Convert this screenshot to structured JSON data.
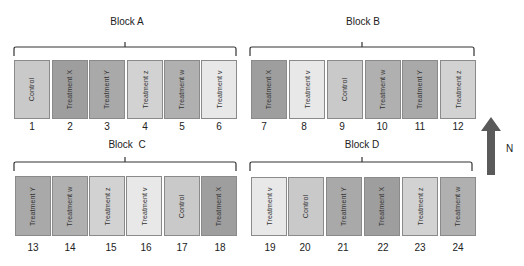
{
  "colors": {
    "Control": "#c9c9c9",
    "Treatment X": "#9e9e9e",
    "Treatment Y": "#a9a9a9",
    "Treatment z": "#d2d2d2",
    "Treatment w": "#b0b0b0",
    "Treatment v": "#e8e8e8"
  },
  "blocks": [
    {
      "label": "Block A",
      "plots": [
        {
          "number": "1",
          "treatment": "Control"
        },
        {
          "number": "2",
          "treatment": "Treatment X"
        },
        {
          "number": "3",
          "treatment": "Treatment Y"
        },
        {
          "number": "4",
          "treatment": "Treatment z"
        },
        {
          "number": "5",
          "treatment": "Treatment w"
        },
        {
          "number": "6",
          "treatment": "Treatment v"
        }
      ]
    },
    {
      "label": "Block B",
      "plots": [
        {
          "number": "7",
          "treatment": "Treatment X"
        },
        {
          "number": "8",
          "treatment": "Treatment v"
        },
        {
          "number": "9",
          "treatment": "Control"
        },
        {
          "number": "10",
          "treatment": "Treatment w"
        },
        {
          "number": "11",
          "treatment": "Treatment Y"
        },
        {
          "number": "12",
          "treatment": "Treatment z"
        }
      ]
    },
    {
      "label": "Block  C",
      "plots": [
        {
          "number": "13",
          "treatment": "Treatment Y"
        },
        {
          "number": "14",
          "treatment": "Treatment w"
        },
        {
          "number": "15",
          "treatment": "Treatment z"
        },
        {
          "number": "16",
          "treatment": "Treatment v"
        },
        {
          "number": "17",
          "treatment": "Control"
        },
        {
          "number": "18",
          "treatment": "Treatment X"
        }
      ]
    },
    {
      "label": "Block D",
      "plots": [
        {
          "number": "19",
          "treatment": "Treatment v"
        },
        {
          "number": "20",
          "treatment": "Control"
        },
        {
          "number": "21",
          "treatment": "Treatment Y"
        },
        {
          "number": "22",
          "treatment": "Treatment X"
        },
        {
          "number": "23",
          "treatment": "Treatment z"
        },
        {
          "number": "24",
          "treatment": "Treatment w"
        }
      ]
    }
  ],
  "compass": {
    "label": "N",
    "arrow_color": "#5a5a5a"
  }
}
